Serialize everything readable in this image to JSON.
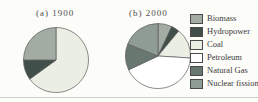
{
  "figure": {
    "background": "#fcfcf9",
    "bottom_rule_color": "#cfcfca",
    "slice_outline_color": "#5a5a5a"
  },
  "chart_data": {
    "type": "pie",
    "description_note": "Two pie charts of energy sources, 1900 vs 2000, values in percent estimated from slice angles (no numeric labels shown in image)",
    "charts": [
      {
        "title": "(a) 1900",
        "start_angle_deg": 0,
        "direction": "clockwise",
        "slices": [
          {
            "label": "Coal",
            "value": 65
          },
          {
            "label": "Hydropower",
            "value": 10
          },
          {
            "label": "Biomass",
            "value": 25
          }
        ]
      },
      {
        "title": "(b) 2000",
        "start_angle_deg": 0,
        "direction": "clockwise",
        "slices": [
          {
            "label": "Biomass",
            "value": 7
          },
          {
            "label": "Hydropower",
            "value": 4
          },
          {
            "label": "Coal",
            "value": 15
          },
          {
            "label": "Petroleum",
            "value": 42
          },
          {
            "label": "Natural Gas",
            "value": 13
          },
          {
            "label": "Nuclear fission",
            "value": 19
          }
        ]
      }
    ],
    "legend": {
      "position": "right",
      "entries": [
        {
          "label": "Biomass",
          "color": "#a2aca2"
        },
        {
          "label": "Hydropower",
          "color": "#414f4b"
        },
        {
          "label": "Coal",
          "color": "#ebeee3"
        },
        {
          "label": "Petroleum",
          "color": "#ffffff"
        },
        {
          "label": "Natural Gas",
          "color": "#68776f"
        },
        {
          "label": "Nuclear fission",
          "color": "#8f9c95"
        }
      ]
    }
  }
}
